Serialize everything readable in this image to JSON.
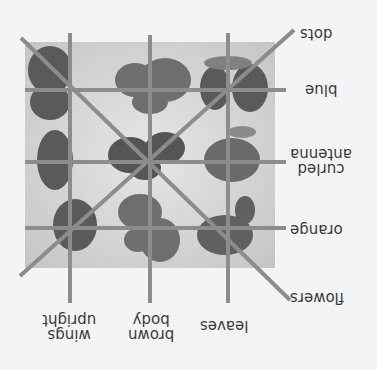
{
  "diagram": {
    "orientation": "rotated 180 degrees",
    "colors": {
      "background": "#f4f4f4",
      "panel": "#d2d2d2",
      "grid_line": "#8c8c8c",
      "wing_dark": "#5a5a5a",
      "wing_mid": "#6e6e6e",
      "text": "#3a3a3a"
    },
    "row_labels": [
      {
        "id": "dots",
        "text": "dots"
      },
      {
        "id": "blue",
        "text": "blue"
      },
      {
        "id": "curled-antenna",
        "text": "curled\nantenna"
      },
      {
        "id": "orange",
        "text": "orange"
      },
      {
        "id": "flowers",
        "text": "flowers"
      }
    ],
    "column_labels": [
      {
        "id": "wings-upright",
        "text": "wings\nupright"
      },
      {
        "id": "brown-body",
        "text": "brown\nbody"
      },
      {
        "id": "leaves",
        "text": "leaves"
      }
    ],
    "cells": [
      [
        "dark spotted butterfly",
        "brown butterfly",
        "butterfly under leaf"
      ],
      [
        "butterfly with curled antenna",
        "spotted butterfly",
        "butterfly on leaf"
      ],
      [
        "dotted wing butterfly",
        "brown butterfly",
        "butterfly on leaves"
      ]
    ]
  }
}
